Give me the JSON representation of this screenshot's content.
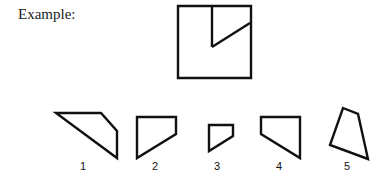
{
  "heading": "Example:",
  "example_figure": {
    "description": "square divided by a vertical line and a diagonal",
    "square": [
      [
        178,
        6
      ],
      [
        251,
        6
      ],
      [
        251,
        78
      ],
      [
        178,
        78
      ]
    ],
    "lines": [
      [
        [
          212,
          6
        ],
        [
          212,
          47
        ]
      ],
      [
        [
          212,
          47
        ],
        [
          250,
          23
        ]
      ]
    ]
  },
  "options": [
    {
      "label": "1",
      "points": [
        [
          56,
          113
        ],
        [
          101,
          113
        ],
        [
          117,
          131
        ],
        [
          117,
          158
        ]
      ],
      "label_x": 73
    },
    {
      "label": "2",
      "points": [
        [
          137,
          117
        ],
        [
          176,
          117
        ],
        [
          176,
          134
        ],
        [
          137,
          158
        ]
      ],
      "label_x": 145
    },
    {
      "label": "3",
      "points": [
        [
          209,
          125
        ],
        [
          233,
          125
        ],
        [
          233,
          136
        ],
        [
          209,
          151
        ]
      ],
      "label_x": 207
    },
    {
      "label": "4",
      "points": [
        [
          261,
          117
        ],
        [
          300,
          117
        ],
        [
          300,
          158
        ],
        [
          261,
          134
        ]
      ],
      "label_x": 269
    },
    {
      "label": "5",
      "points": [
        [
          343,
          108
        ],
        [
          358,
          114
        ],
        [
          368,
          159
        ],
        [
          330,
          145
        ]
      ],
      "label_x": 337
    }
  ],
  "stroke_color": "#111111"
}
